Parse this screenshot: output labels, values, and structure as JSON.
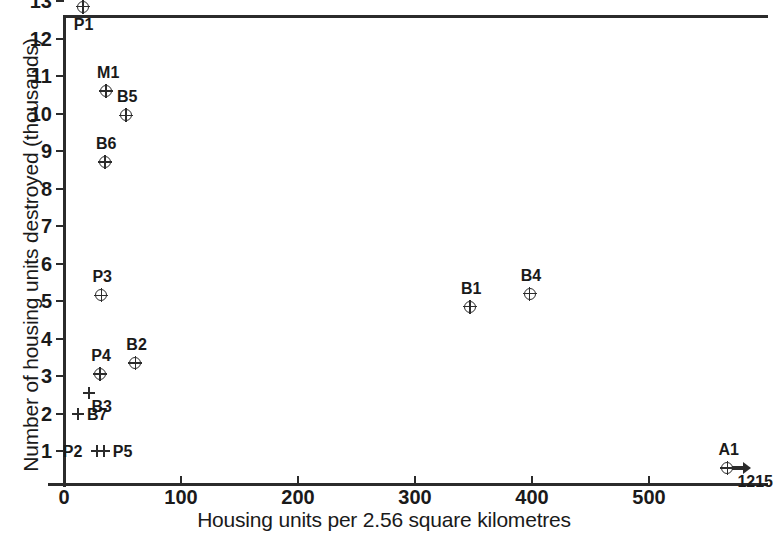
{
  "chart_data": {
    "type": "scatter",
    "title": "",
    "xlabel": "Housing units per 2.56 square kilometres",
    "ylabel": "Number of housing units destroyed (thousands)",
    "xlim": [
      0,
      602
    ],
    "ylim": [
      0,
      13
    ],
    "xticks": [
      0,
      100,
      200,
      300,
      400,
      500
    ],
    "yticks": [
      1,
      2,
      3,
      4,
      5,
      6,
      7,
      8,
      9,
      10,
      11,
      12,
      13
    ],
    "grid": false,
    "legend": null,
    "marker_styles": {
      "circle_plus": "circle with cross inside",
      "plus": "plus sign"
    },
    "points": [
      {
        "label": "P1",
        "x": 16,
        "y": 12.85,
        "marker": "circle_plus",
        "label_pos": "below"
      },
      {
        "label": "M1",
        "x": 36,
        "y": 10.6,
        "marker": "circle_plus",
        "label_pos": "above"
      },
      {
        "label": "B5",
        "x": 53,
        "y": 9.95,
        "marker": "circle_plus",
        "label_pos": "above"
      },
      {
        "label": "B6",
        "x": 35,
        "y": 8.7,
        "marker": "circle_plus",
        "label_pos": "above"
      },
      {
        "label": "P3",
        "x": 32,
        "y": 5.15,
        "marker": "circle_plus",
        "label_pos": "above"
      },
      {
        "label": "B4",
        "x": 398,
        "y": 5.2,
        "marker": "circle_plus",
        "label_pos": "above"
      },
      {
        "label": "B1",
        "x": 347,
        "y": 4.85,
        "marker": "circle_plus",
        "label_pos": "above"
      },
      {
        "label": "B2",
        "x": 61,
        "y": 3.35,
        "marker": "circle_plus",
        "label_pos": "above"
      },
      {
        "label": "P4",
        "x": 31,
        "y": 3.05,
        "marker": "circle_plus",
        "label_pos": "above"
      },
      {
        "label": "B3",
        "x": 21,
        "y": 2.55,
        "marker": "plus",
        "label_pos": "belowright"
      },
      {
        "label": "B7",
        "x": 12,
        "y": 2.0,
        "marker": "plus",
        "label_pos": "right"
      },
      {
        "label": "P2",
        "x": 28,
        "y": 1.0,
        "marker": "plus",
        "label_pos": "left"
      },
      {
        "label": "P5",
        "x": 34,
        "y": 1.0,
        "marker": "plus",
        "label_pos": "right"
      },
      {
        "label": "A1",
        "x": 567,
        "y": 0.55,
        "marker": "circle_plus",
        "label_pos": "above",
        "offscale": true,
        "offscale_value": "1215",
        "arrow": "right"
      }
    ]
  },
  "colors": {
    "ink": "#1a1a1a",
    "axis": "#2b2b2b",
    "background": "#ffffff"
  }
}
